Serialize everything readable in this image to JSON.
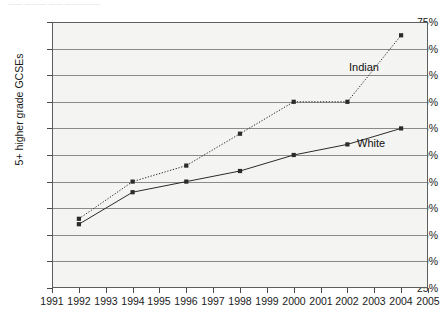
{
  "page": {
    "running_head": "——  ——— —— —————"
  },
  "chart_data": {
    "type": "line",
    "title": "",
    "subtitle": "",
    "xlabel": "",
    "ylabel": "5+ higher grade GCSEs",
    "xlim": [
      1991,
      2005
    ],
    "ylim": [
      25,
      75
    ],
    "ytick_step": 5,
    "grid": true,
    "legend_position": "inline-annotation",
    "x_tick_labels": [
      "1991",
      "1992",
      "1993",
      "1994",
      "1995",
      "1996",
      "1997",
      "1998",
      "1999",
      "2000",
      "2001",
      "2002",
      "2003",
      "2004",
      "2005"
    ],
    "y_tick_labels": [
      "25%",
      "30%",
      "35%",
      "40%",
      "45%",
      "50%",
      "55%",
      "60%",
      "65%",
      "70%",
      "75%"
    ],
    "series": [
      {
        "name": "Indian",
        "style": "dotted",
        "color": "#2b2b2b",
        "marker": "square",
        "label_x": 2002.05,
        "label_y": 67.5,
        "x": [
          1992,
          1994,
          1996,
          1998,
          2000,
          2002,
          2004
        ],
        "values": [
          38,
          45,
          48,
          54,
          60,
          60,
          72.5
        ]
      },
      {
        "name": "White",
        "style": "solid",
        "color": "#2b2b2b",
        "marker": "square",
        "label_x": 2002.35,
        "label_y": 53.2,
        "x": [
          1992,
          1994,
          1996,
          1998,
          2000,
          2002,
          2004
        ],
        "values": [
          37,
          43,
          45,
          47,
          50,
          52,
          55
        ]
      }
    ]
  }
}
